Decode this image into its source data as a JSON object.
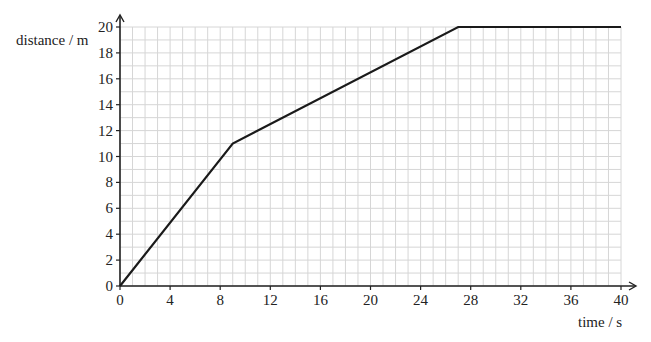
{
  "chart_data": {
    "type": "line",
    "title": "",
    "xlabel": "time / s",
    "ylabel": "distance / m",
    "xlim": [
      0,
      40
    ],
    "ylim": [
      0,
      20
    ],
    "x_ticks": [
      0,
      4,
      8,
      12,
      16,
      20,
      24,
      28,
      32,
      36,
      40
    ],
    "y_ticks": [
      0,
      2,
      4,
      6,
      8,
      10,
      12,
      14,
      16,
      18,
      20
    ],
    "grid": true,
    "grid_minor_step_x": 1,
    "grid_minor_step_y": 1,
    "legend": null,
    "series": [
      {
        "name": "distance",
        "x": [
          0,
          9,
          27,
          40
        ],
        "y": [
          0,
          11,
          20,
          20
        ]
      }
    ]
  },
  "colors": {
    "line": "#1a1a1a",
    "axis": "#222222",
    "grid": "#d6d6d6"
  }
}
